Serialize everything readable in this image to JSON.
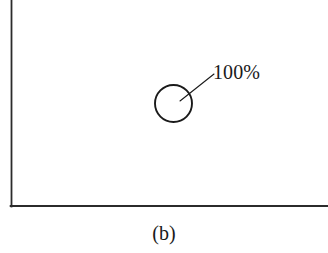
{
  "figure": {
    "caption": "(b)",
    "background_color": "#ffffff",
    "axis_color": "#2b2b2b",
    "stroke_color": "#1a1a1a",
    "text_color": "#1a1a1a",
    "width": 328,
    "height": 253
  },
  "axes": {
    "y_axis": {
      "x": 11,
      "y_top": 0,
      "y_bottom": 206,
      "line_width": 1.8
    },
    "x_axis": {
      "y": 206,
      "x_left": 11,
      "x_right": 328,
      "line_width": 1.8
    },
    "grid": false,
    "x_tick_labels": [],
    "y_tick_labels": [],
    "xlabel": "",
    "ylabel": ""
  },
  "bubble": {
    "label": "100%",
    "center_x": 173.5,
    "center_y": 103.5,
    "radius": 18.5,
    "fill": "none",
    "stroke": "#1a1a1a",
    "stroke_width": 1.9
  },
  "leader_line": {
    "x1": 180,
    "y1": 101,
    "x2": 214,
    "y2": 74,
    "stroke": "#1a1a1a",
    "stroke_width": 1.1
  },
  "chart_data": {
    "type": "scatter",
    "title": "",
    "subtitle": "",
    "xlabel": "",
    "ylabel": "",
    "caption": "(b)",
    "grid": false,
    "legend": null,
    "legend_position": "none",
    "xlim": [
      0,
      100
    ],
    "ylim": [
      0,
      100
    ],
    "x_tick_labels": [],
    "y_tick_labels": [],
    "series": [
      {
        "name": "bubble",
        "marker": "open-circle",
        "points": [
          {
            "x": 51,
            "y": 50,
            "size_percent": 100,
            "data_label": "100%",
            "pixel_center_x": 173.5,
            "pixel_center_y": 103.5,
            "pixel_radius": 18.5
          }
        ]
      }
    ],
    "annotations": [
      {
        "text": "100%",
        "target_pixel": [
          180,
          101
        ],
        "text_pixel": [
          214,
          74
        ],
        "style": "leader-line"
      }
    ]
  }
}
